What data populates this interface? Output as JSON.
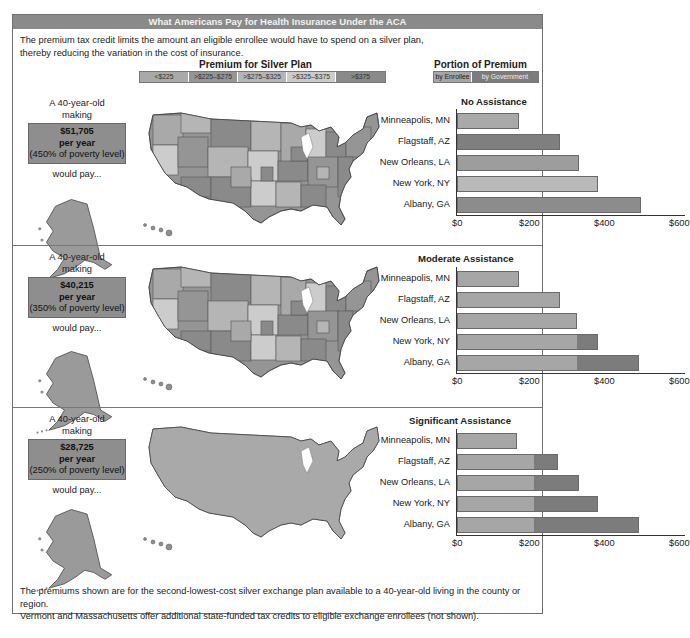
{
  "title": "What Americans Pay for Health Insurance Under the ACA",
  "intro": {
    "line1": "The premium tax credit limits the amount an eligible enrollee would have to spend on a silver plan,",
    "line2": "thereby reducing the variation in the cost of insurance."
  },
  "map_legend": {
    "title": "Premium for Silver Plan",
    "bins": [
      {
        "label": "<$225",
        "color": "#a9a9a9"
      },
      {
        "label": ">$225–$275",
        "color": "#959595"
      },
      {
        "label": ">$275–$325",
        "color": "#b5b5b5"
      },
      {
        "label": ">$325–$375",
        "color": "#cccccc"
      },
      {
        "label": ">$375",
        "color": "#8a8a8a"
      }
    ]
  },
  "portion_legend": {
    "title": "Portion of Premium Paid...",
    "enrollee_label": "by Enrollee",
    "government_label": "by Government",
    "enrollee_color": "#a6a6a6",
    "government_color": "#7c7c7c"
  },
  "sections": [
    {
      "person_line1": "A 40-year-old",
      "person_line2": "making",
      "income": "$51,705",
      "per_year": "per year",
      "poverty": "(450% of poverty level)",
      "would_pay": "would pay...",
      "chart_title": "No Assistance",
      "map_uniform": false
    },
    {
      "person_line1": "A 40-year-old",
      "person_line2": "making",
      "income": "$40,215",
      "per_year": "per year",
      "poverty": "(350% of poverty level)",
      "would_pay": "would pay...",
      "chart_title": "Moderate Assistance",
      "map_uniform": false
    },
    {
      "person_line1": "A 40-year-old",
      "person_line2": "making",
      "income": "$28,725",
      "per_year": "per year",
      "poverty": "(250% of poverty level)",
      "would_pay": "would pay...",
      "chart_title": "Significant Assistance",
      "map_uniform": true
    }
  ],
  "axis": {
    "ticks": [
      "$0",
      "$200",
      "$400",
      "$600"
    ]
  },
  "footer": {
    "line1": "The premiums shown are for the second-lowest-cost silver exchange plan available to a 40-year-old living in the county or region.",
    "line2": "Vermont and Massachusetts offer additional state-funded tax credits to eligible exchange enrollees (not shown)."
  },
  "chart_data": [
    {
      "type": "bar",
      "orientation": "horizontal",
      "stacked": true,
      "title": "No Assistance",
      "subtitle": "A 40-year-old making $51,705 per year (450% of poverty level)",
      "categories": [
        "Minneapolis, MN",
        "Flagstaff, AZ",
        "New Orleans, LA",
        "New York, NY",
        "Albany, GA"
      ],
      "series": [
        {
          "name": "by Enrollee",
          "values": [
            165,
            275,
            325,
            375,
            490
          ]
        },
        {
          "name": "by Government",
          "values": [
            0,
            0,
            0,
            0,
            0
          ]
        }
      ],
      "xlabel": "",
      "ylabel": "",
      "xticks": [
        "$0",
        "$200",
        "$400",
        "$600"
      ],
      "xlim": [
        0,
        600
      ],
      "legend_position": "top"
    },
    {
      "type": "bar",
      "orientation": "horizontal",
      "stacked": true,
      "title": "Moderate Assistance",
      "subtitle": "A 40-year-old making $40,215 per year (350% of poverty level)",
      "categories": [
        "Minneapolis, MN",
        "Flagstaff, AZ",
        "New Orleans, LA",
        "New York, NY",
        "Albany, GA"
      ],
      "series": [
        {
          "name": "by Enrollee",
          "values": [
            165,
            275,
            320,
            320,
            320
          ]
        },
        {
          "name": "by Government",
          "values": [
            0,
            0,
            0,
            55,
            165
          ]
        }
      ],
      "xticks": [
        "$0",
        "$200",
        "$400",
        "$600"
      ],
      "xlim": [
        0,
        600
      ]
    },
    {
      "type": "bar",
      "orientation": "horizontal",
      "stacked": true,
      "title": "Significant Assistance",
      "subtitle": "A 40-year-old making $28,725 per year (250% of poverty level)",
      "categories": [
        "Minneapolis, MN",
        "Flagstaff, AZ",
        "New Orleans, LA",
        "New York, NY",
        "Albany, GA"
      ],
      "series": [
        {
          "name": "by Enrollee",
          "values": [
            160,
            205,
            205,
            205,
            205
          ]
        },
        {
          "name": "by Government",
          "values": [
            0,
            65,
            120,
            170,
            280
          ]
        }
      ],
      "xticks": [
        "$0",
        "$200",
        "$400",
        "$600"
      ],
      "xlim": [
        0,
        600
      ]
    }
  ]
}
